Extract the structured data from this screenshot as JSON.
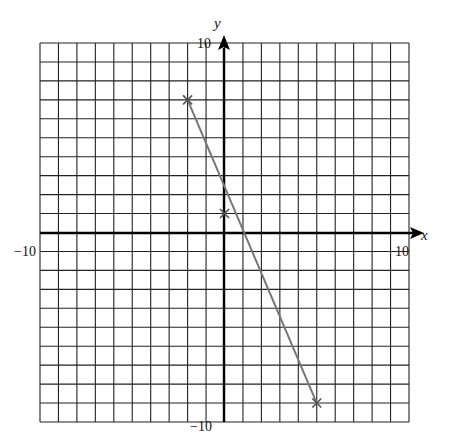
{
  "chart_data": {
    "type": "line",
    "title": "",
    "xlabel": "x",
    "ylabel": "y",
    "xlim": [
      -10,
      10
    ],
    "ylim": [
      -10,
      10
    ],
    "grid": true,
    "grid_step": 1,
    "tick_labels": {
      "x_min": "−10",
      "x_max": "10",
      "y_min": "−10",
      "y_max": "10"
    },
    "series": [
      {
        "name": "line",
        "color": "#777777",
        "marker": "x",
        "points": [
          {
            "x": -2,
            "y": 7
          },
          {
            "x": 0,
            "y": 1
          },
          {
            "x": 5,
            "y": -9
          }
        ]
      }
    ]
  },
  "colors": {
    "grid": "#222222",
    "axis": "#000000",
    "line": "#777777"
  }
}
